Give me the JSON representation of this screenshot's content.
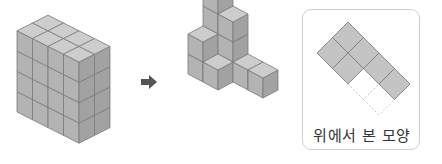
{
  "figure": {
    "left_shape": {
      "description": "rectangular block of unit cubes",
      "width_cubes": 4,
      "depth_cubes": 2,
      "height_cubes": 4
    },
    "arrow": {
      "direction": "right",
      "color": "#555555"
    },
    "middle_shape": {
      "description": "stacked unit cubes remaining after removal"
    },
    "top_view_panel": {
      "label": "위에서 본 모양",
      "filled_cells": 6,
      "dashed_cells": 2,
      "fill_color": "#c4c4c4",
      "border_color": "#cfcfcf"
    }
  },
  "colors": {
    "cube_top": "#cdcdcd",
    "cube_left": "#b3b3b3",
    "cube_right": "#a2a2a2",
    "edge": "#7a7a7a"
  }
}
